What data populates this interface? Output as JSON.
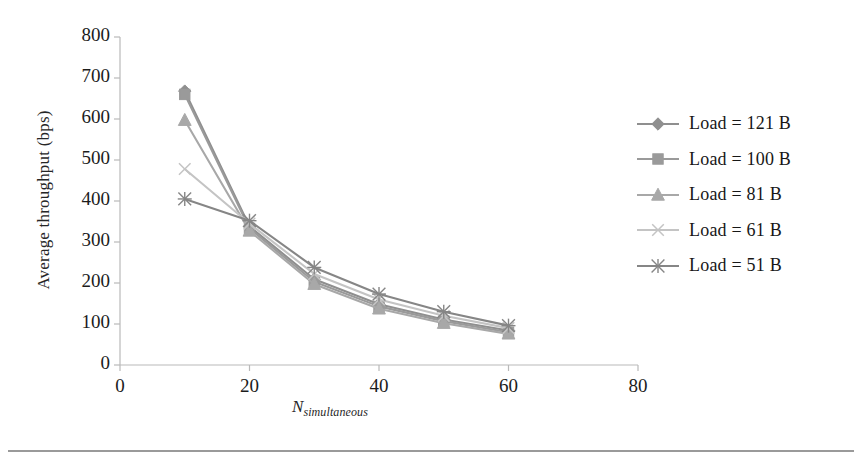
{
  "chart_data": {
    "type": "line",
    "title": "",
    "xlabel": "N_simultaneous",
    "xlabel_base": "N",
    "xlabel_sub": "simultaneous",
    "ylabel": "Average throughput (bps)",
    "x": [
      10,
      20,
      30,
      40,
      50,
      60
    ],
    "xlim": [
      0,
      80
    ],
    "ylim": [
      0,
      800
    ],
    "xticks": [
      "0",
      "20",
      "40",
      "60",
      "80"
    ],
    "xtick_values": [
      0,
      20,
      40,
      60,
      80
    ],
    "yticks": [
      "0",
      "100",
      "200",
      "300",
      "400",
      "500",
      "600",
      "700",
      "800"
    ],
    "ytick_values": [
      0,
      100,
      200,
      300,
      400,
      500,
      600,
      700,
      800
    ],
    "grid": false,
    "legend_position": "right",
    "series": [
      {
        "name": "Load = 121 B",
        "marker": "diamond",
        "color": "#8f8f8f",
        "values": [
          668,
          338,
          209,
          148,
          111,
          84
        ]
      },
      {
        "name": "Load = 100 B",
        "marker": "square",
        "color": "#9a9a9a",
        "values": [
          660,
          333,
          203,
          143,
          107,
          80
        ]
      },
      {
        "name": "Load = 81 B",
        "marker": "triangle",
        "color": "#a8a8a8",
        "values": [
          597,
          327,
          197,
          137,
          102,
          76
        ]
      },
      {
        "name": "Load = 61 B",
        "marker": "x-cross",
        "color": "#c4c4c4",
        "values": [
          478,
          345,
          222,
          160,
          120,
          90
        ]
      },
      {
        "name": "Load = 51 B",
        "marker": "star",
        "color": "#868686",
        "values": [
          405,
          352,
          238,
          173,
          130,
          96
        ]
      }
    ]
  },
  "axes": {
    "y_title": "Average throughput (bps)",
    "x_title_base": "N",
    "x_title_sub": "simultaneous"
  },
  "legend": {
    "items": [
      {
        "label": "Load = 121 B"
      },
      {
        "label": "Load = 100 B"
      },
      {
        "label": "Load = 81 B"
      },
      {
        "label": "Load = 61 B"
      },
      {
        "label": "Load = 51 B"
      }
    ]
  },
  "colors": {
    "axis": "#b9b9b9",
    "text": "#1a1a1a",
    "rule": "#9a9a9a"
  }
}
